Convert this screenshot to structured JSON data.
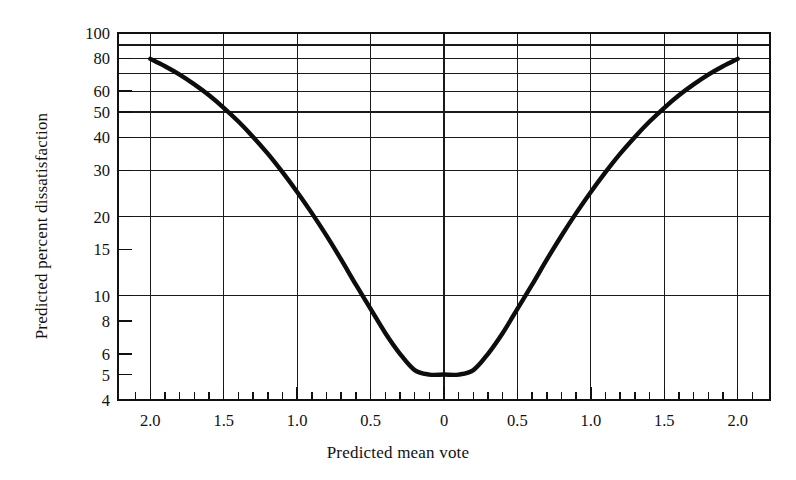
{
  "chart_data": {
    "type": "line",
    "title": "",
    "xlabel": "Predicted mean vote",
    "ylabel": "Predicted percent dissatisfaction",
    "xlim": [
      -2.22,
      2.22
    ],
    "ylim": [
      4,
      100
    ],
    "yscale": "log",
    "xscale": "linear",
    "grid": true,
    "legend": null,
    "x_ticks": [
      {
        "value": -2.0,
        "label": "2.0"
      },
      {
        "value": -1.5,
        "label": "1.5"
      },
      {
        "value": -1.0,
        "label": "1.0"
      },
      {
        "value": -0.5,
        "label": "0.5"
      },
      {
        "value": 0.0,
        "label": "0"
      },
      {
        "value": 0.5,
        "label": "0.5"
      },
      {
        "value": 1.0,
        "label": "1.0"
      },
      {
        "value": 1.5,
        "label": "1.5"
      },
      {
        "value": 2.0,
        "label": "2.0"
      }
    ],
    "x_minor_ticks": [
      -2.1,
      -1.9,
      -1.8,
      -1.7,
      -1.6,
      -1.4,
      -1.3,
      -1.2,
      -1.1,
      -0.9,
      -0.8,
      -0.7,
      -0.6,
      -0.4,
      -0.3,
      -0.2,
      -0.1,
      0.1,
      0.2,
      0.3,
      0.4,
      0.6,
      0.7,
      0.8,
      0.9,
      1.1,
      1.2,
      1.3,
      1.4,
      1.6,
      1.7,
      1.8,
      1.9,
      2.1
    ],
    "y_ticks": [
      {
        "value": 100,
        "label": "100"
      },
      {
        "value": 80,
        "label": "80"
      },
      {
        "value": 60,
        "label": "60"
      },
      {
        "value": 50,
        "label": "50"
      },
      {
        "value": 40,
        "label": "40"
      },
      {
        "value": 30,
        "label": "30"
      },
      {
        "value": 20,
        "label": "20"
      },
      {
        "value": 15,
        "label": "15"
      },
      {
        "value": 10,
        "label": "10"
      },
      {
        "value": 8,
        "label": "8"
      },
      {
        "value": 6,
        "label": "6"
      },
      {
        "value": 5,
        "label": "5"
      },
      {
        "value": 4,
        "label": "4"
      }
    ],
    "y_gridlines": [
      100,
      90,
      80,
      70,
      60,
      50,
      40,
      30,
      20,
      10
    ],
    "y_ticks_no_gridline": [
      15,
      8,
      6,
      5,
      4
    ],
    "series": [
      {
        "name": "Predicted percent dissatisfaction",
        "color": "#0d0d0d",
        "x": [
          -2.0,
          -1.9,
          -1.8,
          -1.7,
          -1.6,
          -1.5,
          -1.4,
          -1.3,
          -1.2,
          -1.1,
          -1.0,
          -0.9,
          -0.8,
          -0.7,
          -0.6,
          -0.5,
          -0.4,
          -0.3,
          -0.2,
          -0.1,
          0.0,
          0.1,
          0.2,
          0.3,
          0.4,
          0.5,
          0.6,
          0.7,
          0.8,
          0.9,
          1.0,
          1.1,
          1.2,
          1.3,
          1.4,
          1.5,
          1.6,
          1.7,
          1.8,
          1.9,
          2.0
        ],
        "y": [
          79.7,
          74.7,
          69.4,
          63.7,
          57.9,
          51.9,
          46.0,
          40.2,
          34.7,
          29.5,
          24.8,
          20.6,
          16.9,
          13.7,
          11.0,
          8.9,
          7.2,
          6.0,
          5.2,
          5.0,
          5.0,
          5.0,
          5.2,
          6.0,
          7.2,
          8.9,
          11.0,
          13.7,
          16.9,
          20.6,
          24.8,
          29.5,
          34.7,
          40.2,
          46.0,
          51.9,
          57.9,
          63.7,
          69.4,
          74.7,
          79.7
        ],
        "formula": "PPD = 100 - 95 * exp(-0.03353*PMV^4 - 0.2179*PMV^2)"
      }
    ],
    "annotations": []
  },
  "axes": {
    "x_title": "Predicted mean vote",
    "y_title": "Predicted percent dissatisfaction"
  }
}
